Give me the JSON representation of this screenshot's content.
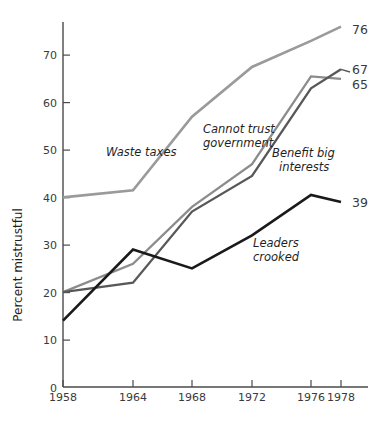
{
  "chart_data": {
    "type": "line",
    "title": "",
    "xlabel": "",
    "ylabel": "Percent mistrustful",
    "x": [
      1958,
      1964,
      1968,
      1972,
      1976,
      1978
    ],
    "categories": [
      "1958",
      "1964",
      "1968",
      "1972",
      "1976",
      "1978"
    ],
    "xlim": [
      1958,
      1978
    ],
    "ylim": [
      0,
      77
    ],
    "yticks": [
      0,
      10,
      20,
      30,
      40,
      50,
      60,
      70
    ],
    "ytick_labels": [
      "0",
      "10",
      "20",
      "30",
      "40",
      "50",
      "60",
      "70"
    ],
    "xticks": [
      1958,
      1964,
      1968,
      1972,
      1976,
      1978
    ],
    "xtick_labels": [
      "1958",
      "1964",
      "1968",
      "1972",
      "1976",
      "1978"
    ],
    "grid": false,
    "legend_position": "inline-annotations",
    "series": [
      {
        "name": "Waste taxes",
        "color": "#9a9a9a",
        "values": [
          40,
          41.5,
          57,
          67.5,
          73,
          76
        ],
        "end_value_label": "76",
        "annotation": "Waste taxes"
      },
      {
        "name": "Cannot trust government",
        "color": "#8c8c8c",
        "values": [
          20,
          26,
          38,
          47,
          65.5,
          65
        ],
        "end_value_label": "65",
        "annotation": "Cannot trust government",
        "annotation_line1": "Cannot trust",
        "annotation_line2": "government"
      },
      {
        "name": "Benefit big interests",
        "color": "#585858",
        "values": [
          20,
          22,
          37,
          44.5,
          63,
          67
        ],
        "end_value_label": "67",
        "annotation": "Benefit big interests",
        "annotation_line1": "Benefit big",
        "annotation_line2": "interests"
      },
      {
        "name": "Leaders crooked",
        "color": "#1a1a1a",
        "values": [
          14,
          29,
          25,
          32,
          40.5,
          39
        ],
        "end_value_label": "39",
        "annotation": "Leaders crooked",
        "annotation_line1": "Leaders",
        "annotation_line2": "crooked"
      }
    ]
  },
  "axis": {
    "y_title": "Percent mistrustful"
  },
  "end_labels": {
    "waste_taxes": "76",
    "benefit_big_interests": "67",
    "cannot_trust_government": "65",
    "leaders_crooked": "39"
  },
  "ytick_values": {
    "t0": "0",
    "t1": "10",
    "t2": "20",
    "t3": "30",
    "t4": "40",
    "t5": "50",
    "t6": "60",
    "t7": "70"
  },
  "xtick_values": {
    "t0": "1958",
    "t1": "1964",
    "t2": "1968",
    "t3": "1972",
    "t4": "1976",
    "t5": "1978"
  },
  "annotations": {
    "waste_taxes": "Waste taxes",
    "cannot_trust_1": "Cannot trust",
    "cannot_trust_2": "government",
    "benefit_big_1": "Benefit big",
    "benefit_big_2": "interests",
    "leaders_1": "Leaders",
    "leaders_2": "crooked"
  }
}
